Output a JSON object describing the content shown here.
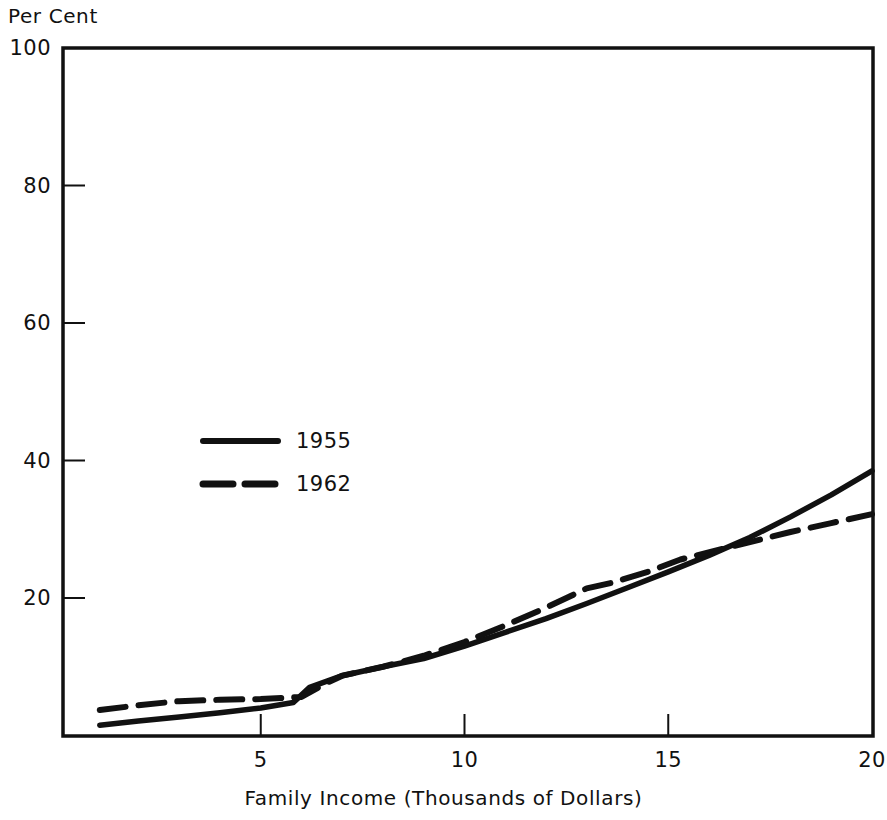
{
  "chart_data": {
    "type": "line",
    "title": "",
    "ylabel": "Per Cent",
    "xlabel": "Family Income (Thousands of Dollars)",
    "xlim": [
      0,
      20
    ],
    "ylim": [
      0,
      100
    ],
    "xticks": [
      5,
      10,
      15,
      20
    ],
    "xtick_labels": [
      "5",
      "10",
      "15",
      "20"
    ],
    "yticks": [
      20,
      40,
      60,
      80,
      100
    ],
    "ytick_labels": [
      "20",
      "40",
      "60",
      "80",
      "100"
    ],
    "grid": false,
    "legend_position": "center-left",
    "series": [
      {
        "name": "1955",
        "style": "solid",
        "color": "#111111",
        "x": [
          1.05,
          2.0,
          3.0,
          4.0,
          5.0,
          5.8,
          6.2,
          7.0,
          8.0,
          9.0,
          10.0,
          11.0,
          12.0,
          13.0,
          14.0,
          15.0,
          16.0,
          17.0,
          18.0,
          19.0,
          20.0
        ],
        "values": [
          1.5,
          2.1,
          2.7,
          3.3,
          4.0,
          4.8,
          7.0,
          8.7,
          10.0,
          11.2,
          13.0,
          15.0,
          17.0,
          19.2,
          21.5,
          23.8,
          26.2,
          28.8,
          31.8,
          35.0,
          38.5
        ]
      },
      {
        "name": "1962",
        "style": "dashed",
        "color": "#111111",
        "x": [
          1.05,
          2.0,
          3.0,
          4.0,
          5.0,
          6.0,
          6.6,
          7.0,
          8.0,
          9.0,
          10.0,
          11.0,
          12.0,
          13.0,
          13.6,
          14.5,
          15.3,
          16.5,
          18.0,
          19.0,
          20.0
        ],
        "values": [
          3.7,
          4.4,
          5.0,
          5.2,
          5.3,
          5.6,
          7.6,
          8.7,
          10.0,
          11.6,
          13.6,
          16.0,
          18.6,
          21.4,
          22.2,
          23.8,
          25.6,
          27.4,
          29.6,
          30.9,
          32.2
        ]
      }
    ]
  },
  "legend": {
    "entries": [
      {
        "label": "1955",
        "style": "solid"
      },
      {
        "label": "1962",
        "style": "dashed"
      }
    ]
  },
  "axes": {
    "y_axis_title": "Per Cent",
    "x_axis_title": "Family Income (Thousands of Dollars)"
  }
}
